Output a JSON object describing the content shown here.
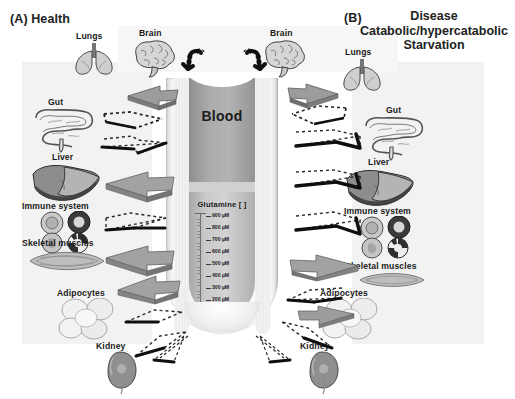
{
  "figure": {
    "panel_a": {
      "tag": "(A)",
      "title": "Health",
      "label": "(A) Health"
    },
    "panel_b": {
      "tag": "(B)",
      "title_line1": "Disease",
      "title_line2": "Catabolic/hypercatabolic",
      "title_line3": "Starvation"
    },
    "tube": {
      "compartment_label": "Blood",
      "metabolite_label": "Glutamine [ ]",
      "scale_unit": "µM",
      "scale_ticks": [
        "900 µM",
        "800 µM",
        "700 µM",
        "600 µM",
        "500 µM",
        "400 µM",
        "300 µM",
        "200 µM"
      ],
      "scale_values": [
        900,
        800,
        700,
        600,
        500,
        400,
        300,
        200
      ]
    },
    "organs_left": [
      {
        "name": "Lungs",
        "icon": "lungs-icon"
      },
      {
        "name": "Brain",
        "icon": "brain-icon"
      },
      {
        "name": "Gut",
        "icon": "gut-icon"
      },
      {
        "name": "Liver",
        "icon": "liver-icon"
      },
      {
        "name": "Immune system",
        "icon": "immune-cells-icon"
      },
      {
        "name": "Skeletal muscles",
        "icon": "muscle-icon"
      },
      {
        "name": "Adipocytes",
        "icon": "adipocytes-icon"
      },
      {
        "name": "Kidney",
        "icon": "kidney-icon"
      }
    ],
    "organs_right": [
      {
        "name": "Brain",
        "icon": "brain-icon"
      },
      {
        "name": "Lungs",
        "icon": "lungs-icon"
      },
      {
        "name": "Gut",
        "icon": "gut-icon"
      },
      {
        "name": "Liver",
        "icon": "liver-icon"
      },
      {
        "name": "Immune system",
        "icon": "immune-cells-icon"
      },
      {
        "name": "Skeletal muscles",
        "icon": "muscle-icon"
      },
      {
        "name": "Adipocytes",
        "icon": "adipocytes-icon"
      },
      {
        "name": "Kidney",
        "icon": "kidney-icon"
      }
    ],
    "colors": {
      "page_background": "#ffffff",
      "panel_tint": "#f2f2f2",
      "blood_fill": "#a3a3a3",
      "tube_glass": "#e8e8e8",
      "solid_arrow": "#9a9a9a",
      "beaded_arrow": "#121212",
      "dotted_arrow": "#2a2a2a",
      "text": "#1a1a1a"
    }
  }
}
